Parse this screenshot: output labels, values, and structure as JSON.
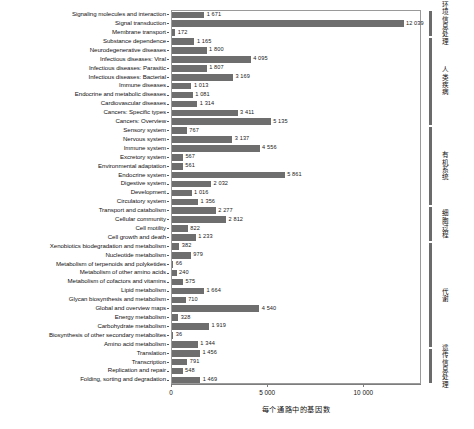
{
  "chart_data": {
    "type": "bar",
    "orientation": "horizontal",
    "title": "",
    "xlabel": "每个通路中的基因数",
    "ylabel": "",
    "xlim": [
      0,
      13000
    ],
    "xticks": [
      0,
      5000,
      10000
    ],
    "xticklabels": [
      "0",
      "5 000",
      "10 000"
    ],
    "grid": false,
    "legend": false,
    "bar_color": "#6e6e6e",
    "categories": [
      "Signaling molecules and interaction",
      "Signal transduction",
      "Membrane transport",
      "Substance dependence",
      "Neurodegenerative diseases",
      "Infectious diseases: Viral",
      "Infectious diseases: Parasitic",
      "Infectious diseases: Bacterial",
      "Immune diseases",
      "Endocrine and metabolic diseases",
      "Cardiovascular diseases",
      "Cancers: Specific types",
      "Cancers: Overview",
      "Sensory system",
      "Nervous system",
      "Immune system",
      "Excretory system",
      "Environmental adaptation",
      "Endocrine system",
      "Digestive system",
      "Development",
      "Circulatory system",
      "Transport and catabolism",
      "Cellular community",
      "Cell motility",
      "Cell growth and death",
      "Xenobiotics biodegradation and metabolism",
      "Nucleotide metabolism",
      "Metabolism of terpenoids and polyketides",
      "Metabolism of other amino acids",
      "Metabolism of cofactors and vitamins",
      "Lipid metabolism",
      "Glycan biosynthesis and metabolism",
      "Global and overview maps",
      "Energy metabolism",
      "Carbohydrate metabolism",
      "Biosynthesis of other secondary metabolites",
      "Amino acid metabolism",
      "Translation",
      "Transcription",
      "Replication and repair",
      "Folding, sorting and degradation"
    ],
    "values": [
      1671,
      12039,
      172,
      1165,
      1800,
      4095,
      1807,
      3169,
      1013,
      1081,
      1314,
      3411,
      5135,
      767,
      3137,
      4556,
      567,
      561,
      5861,
      2032,
      1016,
      1356,
      2277,
      2812,
      822,
      1233,
      382,
      979,
      66,
      240,
      575,
      1664,
      710,
      4540,
      328,
      1919,
      36,
      1344,
      1456,
      791,
      548,
      1469
    ],
    "value_labels": [
      "1 671",
      "12 039",
      "172",
      "1 165",
      "1 800",
      "4 095",
      "1 807",
      "3 169",
      "1 013",
      "1 081",
      "1 314",
      "3 411",
      "5 135",
      "767",
      "3 137",
      "4 556",
      "567",
      "561",
      "5 861",
      "2 032",
      "1 016",
      "1 356",
      "2 277",
      "2 812",
      "822",
      "1 233",
      "382",
      "979",
      "66",
      "240",
      "575",
      "1 664",
      "710",
      "4 540",
      "328",
      "1 919",
      "36",
      "1 344",
      "1 456",
      "791",
      "548",
      "1 469"
    ],
    "groups": [
      {
        "label": "环境信息处理",
        "start": 0,
        "end": 2
      },
      {
        "label": "人类疾病",
        "start": 3,
        "end": 12
      },
      {
        "label": "有机系统",
        "start": 13,
        "end": 21
      },
      {
        "label": "细胞过程",
        "start": 22,
        "end": 25
      },
      {
        "label": "代谢",
        "start": 26,
        "end": 37
      },
      {
        "label": "遗传信息处理",
        "start": 38,
        "end": 41
      }
    ]
  }
}
